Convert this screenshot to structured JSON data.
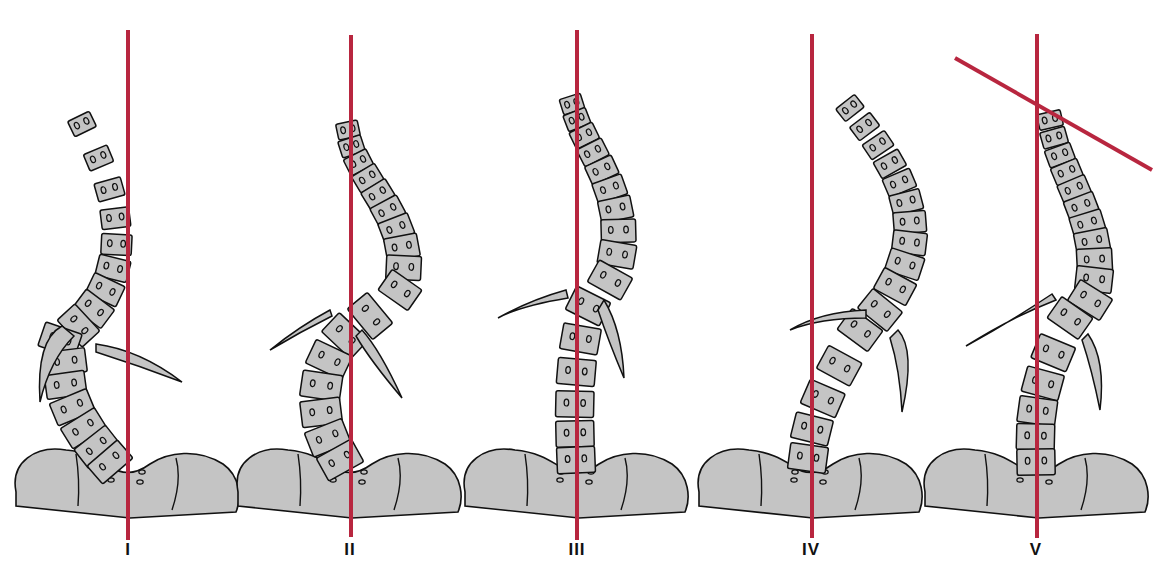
{
  "figure": {
    "line_color": "#b8263f",
    "bone_fill": "#c4c4c4",
    "outline_color": "#111111",
    "panels": [
      {
        "label": "I",
        "line_x": 128,
        "line_top": 30,
        "line_bottom": 540
      },
      {
        "label": "II",
        "line_x": 351,
        "line_top": 35,
        "line_bottom": 537
      },
      {
        "label": "III",
        "line_x": 577,
        "line_top": 30,
        "line_bottom": 540
      },
      {
        "label": "IV",
        "line_x": 812,
        "line_top": 34,
        "line_bottom": 538
      },
      {
        "label": "V",
        "line_x": 1037,
        "line_top": 34,
        "line_bottom": 538
      }
    ],
    "panel_v_oblique_line": {
      "x1": 955,
      "y1": 58,
      "x2": 1152,
      "y2": 170
    }
  }
}
